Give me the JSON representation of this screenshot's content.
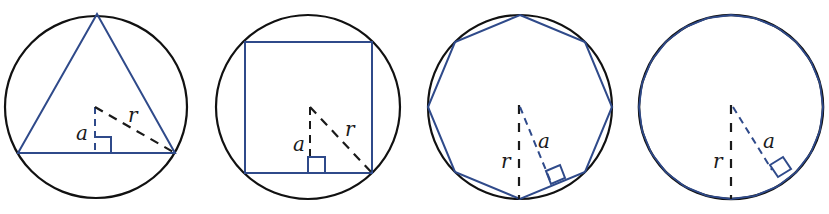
{
  "figure": {
    "colors": {
      "circle": "#111111",
      "polygon": "#2f4a8a",
      "dashed": "#1a1a1a"
    },
    "panels": [
      {
        "shape": "triangle",
        "sides": 3,
        "labels": {
          "apothem": "a",
          "radius": "r"
        }
      },
      {
        "shape": "square",
        "sides": 4,
        "labels": {
          "apothem": "a",
          "radius": "r"
        }
      },
      {
        "shape": "octagon",
        "sides": 8,
        "labels": {
          "apothem": "a",
          "radius": "r"
        }
      },
      {
        "shape": "many-sided polygon",
        "sides": 24,
        "labels": {
          "apothem": "a",
          "radius": "r"
        }
      }
    ]
  }
}
